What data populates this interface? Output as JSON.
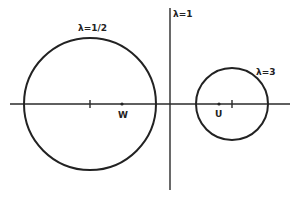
{
  "diagram": {
    "type": "apollonian-circles",
    "colors": {
      "ink": "#222222",
      "background": "#ffffff"
    },
    "circles": [
      {
        "id": "lambda-half",
        "label": "λ=1/2",
        "note": "larger circle on left, encloses W"
      },
      {
        "id": "lambda-three",
        "label": "λ=3",
        "note": "smaller circle on right, encloses U"
      }
    ],
    "line": {
      "id": "lambda-one",
      "label": "λ=1",
      "note": "vertical line between the circles"
    },
    "points": [
      {
        "id": "W",
        "label": "W"
      },
      {
        "id": "U",
        "label": "U"
      }
    ],
    "axis": {
      "label": ""
    }
  }
}
